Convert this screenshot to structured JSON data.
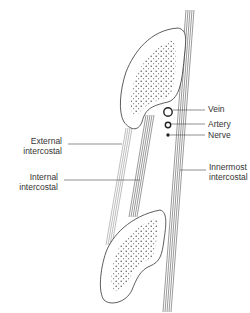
{
  "diagram": {
    "labels": {
      "vein": "Vein",
      "artery": "Artery",
      "nerve": "Nerve",
      "external_1": "External",
      "external_2": "intercostal",
      "internal_1": "Internal",
      "internal_2": "intercostal",
      "innermost_1": "Innermost",
      "innermost_2": "intercostal"
    },
    "structures": [
      "upper rib",
      "lower rib",
      "external intercostal muscle",
      "internal intercostal muscle",
      "innermost intercostal muscle",
      "intercostal vein",
      "intercostal artery",
      "intercostal nerve"
    ],
    "colors": {
      "line": "#333333",
      "muscle": "#555555",
      "background": "#ffffff"
    }
  }
}
